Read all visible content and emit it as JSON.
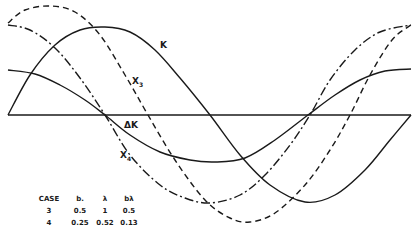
{
  "chart_data": {
    "type": "line",
    "title": "",
    "xlabel": "",
    "ylabel": "",
    "grid": false,
    "baseline": {
      "y_px": 115,
      "x_start_px": 8,
      "x_end_px": 411
    },
    "series": [
      {
        "name": "K",
        "style": "solid",
        "points_px": [
          [
            8,
            115
          ],
          [
            30,
            75
          ],
          [
            55,
            45
          ],
          [
            80,
            30
          ],
          [
            105,
            27
          ],
          [
            130,
            32
          ],
          [
            155,
            50
          ],
          [
            180,
            78
          ],
          [
            210,
            115
          ],
          [
            240,
            155
          ],
          [
            270,
            185
          ],
          [
            305,
            202
          ],
          [
            335,
            195
          ],
          [
            365,
            170
          ],
          [
            390,
            140
          ],
          [
            411,
            115
          ]
        ]
      },
      {
        "name": "ΔK",
        "style": "solid",
        "points_px": [
          [
            8,
            70
          ],
          [
            35,
            74
          ],
          [
            60,
            85
          ],
          [
            85,
            100
          ],
          [
            105,
            115
          ],
          [
            130,
            135
          ],
          [
            160,
            152
          ],
          [
            190,
            160
          ],
          [
            215,
            162
          ],
          [
            245,
            158
          ],
          [
            275,
            140
          ],
          [
            308,
            115
          ],
          [
            335,
            95
          ],
          [
            360,
            80
          ],
          [
            385,
            71
          ],
          [
            411,
            69
          ]
        ]
      },
      {
        "name": "X3",
        "style": "dashed",
        "points_px": [
          [
            8,
            23
          ],
          [
            25,
            10
          ],
          [
            50,
            6
          ],
          [
            75,
            12
          ],
          [
            100,
            35
          ],
          [
            125,
            75
          ],
          [
            148,
            115
          ],
          [
            175,
            160
          ],
          [
            205,
            200
          ],
          [
            230,
            218
          ],
          [
            250,
            222
          ],
          [
            275,
            213
          ],
          [
            305,
            185
          ],
          [
            330,
            150
          ],
          [
            350,
            115
          ],
          [
            370,
            75
          ],
          [
            392,
            40
          ],
          [
            411,
            25
          ]
        ]
      },
      {
        "name": "X4",
        "style": "dash-dot",
        "points_px": [
          [
            8,
            25
          ],
          [
            30,
            30
          ],
          [
            55,
            48
          ],
          [
            80,
            78
          ],
          [
            105,
            115
          ],
          [
            130,
            155
          ],
          [
            160,
            185
          ],
          [
            185,
            198
          ],
          [
            210,
            203
          ],
          [
            240,
            195
          ],
          [
            265,
            175
          ],
          [
            290,
            145
          ],
          [
            310,
            115
          ],
          [
            330,
            80
          ],
          [
            355,
            50
          ],
          [
            380,
            32
          ],
          [
            411,
            25
          ]
        ]
      }
    ],
    "annotations": [
      {
        "text": "K",
        "x_px": 162,
        "y_px": 47
      },
      {
        "text": "X3",
        "x_px": 134,
        "y_px": 83
      },
      {
        "text": "ΔK",
        "x_px": 126,
        "y_px": 126
      },
      {
        "text": "X4",
        "x_px": 122,
        "y_px": 158
      }
    ],
    "table": {
      "columns": [
        "CASE",
        "b.",
        "λ",
        "bλ"
      ],
      "rows": [
        [
          "3",
          "0.5",
          "1",
          "0.5"
        ],
        [
          "4",
          "0.25",
          "0.52",
          "0.13"
        ]
      ]
    }
  },
  "labels": {
    "k": "K",
    "x3_main": "X",
    "x3_sub": "3",
    "dk": "ΔK",
    "x4_main": "X",
    "x4_sub": "4"
  },
  "table": {
    "headers": [
      "CASE",
      "b.",
      "λ",
      "bλ"
    ],
    "rows": [
      [
        "3",
        "0.5",
        "1",
        "0.5"
      ],
      [
        "4",
        "0.25",
        "0.52",
        "0.13"
      ]
    ]
  }
}
